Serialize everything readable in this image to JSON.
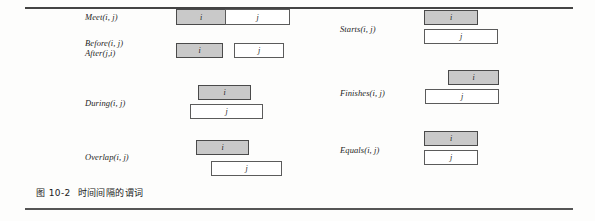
{
  "figure": {
    "caption_number": "图 10-2",
    "caption_text": "时间间隔的谓词",
    "filled_box_color": "#c9c9c9",
    "border_color": "#5b5b5b"
  },
  "left_column": {
    "rows": [
      {
        "name": "meet",
        "label": "Meet(i, j)",
        "label2": "",
        "boxes": [
          {
            "text": "i",
            "filled": true
          },
          {
            "text": "j",
            "filled": false
          }
        ]
      },
      {
        "name": "before-after",
        "label": "Before(i, j)",
        "label2": "After(j,i)",
        "boxes": [
          {
            "text": "i",
            "filled": true
          },
          {
            "text": "j",
            "filled": false
          }
        ]
      },
      {
        "name": "during",
        "label": "During(i, j)",
        "label2": "",
        "boxes": [
          {
            "text": "i",
            "filled": true
          },
          {
            "text": "j",
            "filled": false
          }
        ]
      },
      {
        "name": "overlap",
        "label": "Overlap(i, j)",
        "label2": "",
        "boxes": [
          {
            "text": "i",
            "filled": true
          },
          {
            "text": "j",
            "filled": false
          }
        ]
      }
    ]
  },
  "right_column": {
    "rows": [
      {
        "name": "starts",
        "label": "Starts(i, j)",
        "boxes": [
          {
            "text": "i",
            "filled": true
          },
          {
            "text": "j",
            "filled": false
          }
        ]
      },
      {
        "name": "finishes",
        "label": "Finishes(i, j)",
        "boxes": [
          {
            "text": "i",
            "filled": true
          },
          {
            "text": "j",
            "filled": false
          }
        ]
      },
      {
        "name": "equals",
        "label": "Equals(i, j)",
        "boxes": [
          {
            "text": "i",
            "filled": true
          },
          {
            "text": "j",
            "filled": false
          }
        ]
      }
    ]
  }
}
